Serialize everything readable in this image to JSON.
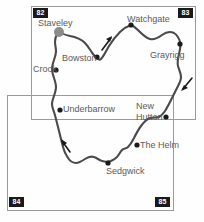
{
  "map": {
    "type": "route-map",
    "description": "Circular route map with labelled waypoints and direction arrows",
    "route_color": "#4a4a4a",
    "label_color": "#5a5a5a",
    "grid_box_color": "#1a1a1a",
    "grid_squares": [
      {
        "label": "82",
        "position": "top-left"
      },
      {
        "label": "83",
        "position": "top-right"
      },
      {
        "label": "84",
        "position": "bottom-left"
      },
      {
        "label": "85",
        "position": "bottom-right"
      }
    ],
    "places": [
      {
        "name": "Staveley",
        "marker": "large-dot"
      },
      {
        "name": "Watchgate",
        "marker": "dot"
      },
      {
        "name": "Grayrigg",
        "marker": "dot"
      },
      {
        "name": "Bowston",
        "marker": "dot"
      },
      {
        "name": "Crook",
        "marker": "dot"
      },
      {
        "name": "Underbarrow",
        "marker": "dot"
      },
      {
        "name": "New Hutton",
        "name_line1": "New",
        "name_line2": "Hutton",
        "marker": "dot"
      },
      {
        "name": "The Helm",
        "marker": "dot"
      },
      {
        "name": "Sedgwick",
        "marker": "dot"
      }
    ],
    "direction_arrows": [
      {
        "id": "arrow-north-east",
        "heading": "north-east"
      },
      {
        "id": "arrow-south-west-right",
        "heading": "south-west"
      },
      {
        "id": "arrow-north-west-left",
        "heading": "north-west"
      }
    ]
  }
}
